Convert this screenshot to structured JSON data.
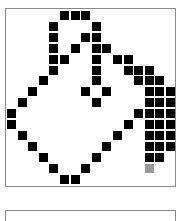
{
  "editor": {
    "grid_size": 16,
    "origin_x": 7,
    "origin_y": 11,
    "pitch_x": 10.6,
    "pitch_y": 10.9,
    "colors": {
      "on": "#000000",
      "dim": "#999999",
      "off": "#ffffff",
      "border": "#8a8a8a"
    },
    "filled_cells": [
      [
        0,
        5
      ],
      [
        0,
        6
      ],
      [
        0,
        7
      ],
      [
        1,
        4
      ],
      [
        1,
        8
      ],
      [
        2,
        4
      ],
      [
        2,
        7
      ],
      [
        2,
        8
      ],
      [
        3,
        4
      ],
      [
        3,
        6
      ],
      [
        3,
        8
      ],
      [
        3,
        9
      ],
      [
        4,
        4
      ],
      [
        4,
        5
      ],
      [
        4,
        8
      ],
      [
        4,
        10
      ],
      [
        4,
        11
      ],
      [
        5,
        4
      ],
      [
        5,
        8
      ],
      [
        5,
        11
      ],
      [
        5,
        12
      ],
      [
        5,
        13
      ],
      [
        6,
        3
      ],
      [
        6,
        8
      ],
      [
        6,
        12
      ],
      [
        6,
        13
      ],
      [
        6,
        14
      ],
      [
        7,
        2
      ],
      [
        7,
        7
      ],
      [
        7,
        9
      ],
      [
        7,
        13
      ],
      [
        7,
        14
      ],
      [
        7,
        15
      ],
      [
        8,
        1
      ],
      [
        8,
        8
      ],
      [
        8,
        13
      ],
      [
        8,
        14
      ],
      [
        8,
        15
      ],
      [
        9,
        0
      ],
      [
        9,
        12
      ],
      [
        9,
        13
      ],
      [
        9,
        14
      ],
      [
        9,
        15
      ],
      [
        10,
        0
      ],
      [
        10,
        11
      ],
      [
        10,
        13
      ],
      [
        10,
        14
      ],
      [
        10,
        15
      ],
      [
        11,
        1
      ],
      [
        11,
        10
      ],
      [
        11,
        13
      ],
      [
        11,
        14
      ],
      [
        11,
        15
      ],
      [
        12,
        2
      ],
      [
        12,
        9
      ],
      [
        12,
        13
      ],
      [
        12,
        14
      ],
      [
        12,
        15
      ],
      [
        13,
        3
      ],
      [
        13,
        8
      ],
      [
        13,
        13
      ],
      [
        13,
        14
      ],
      [
        14,
        4
      ],
      [
        14,
        7
      ],
      [
        15,
        5
      ],
      [
        15,
        6
      ]
    ],
    "dim_cells": [
      [
        14,
        13
      ]
    ]
  },
  "preview": {}
}
